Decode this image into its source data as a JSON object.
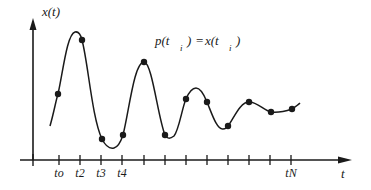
{
  "diagram": {
    "y_axis_label": "x(t)",
    "x_axis_label": "t",
    "equation": {
      "lhs_func": "p(t",
      "lhs_sub": "i",
      "lhs_close": ")",
      "equals": "=",
      "rhs_func": "x(t",
      "rhs_sub": "i",
      "rhs_close": ")"
    },
    "tick_labels": [
      {
        "label": "to",
        "x": 59
      },
      {
        "label": "t2",
        "x": 80
      },
      {
        "label": "t3",
        "x": 101
      },
      {
        "label": "t4",
        "x": 122
      },
      {
        "label": "tN",
        "x": 291
      }
    ],
    "ticks_x": [
      59,
      80,
      101,
      122,
      144,
      165,
      186,
      207,
      228,
      249,
      270,
      291
    ],
    "sample_points": [
      [
        58,
        94
      ],
      [
        82,
        40
      ],
      [
        102,
        139
      ],
      [
        123,
        135
      ],
      [
        144,
        62
      ],
      [
        165,
        135
      ],
      [
        186,
        99
      ],
      [
        207,
        102
      ],
      [
        228,
        126
      ],
      [
        249,
        102
      ],
      [
        271,
        112
      ],
      [
        292,
        109
      ]
    ],
    "colors": {
      "ink": "#1a1a1a",
      "background": "#ffffff"
    }
  }
}
